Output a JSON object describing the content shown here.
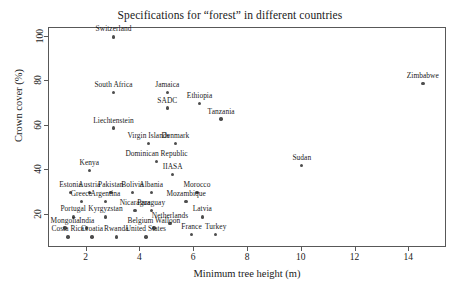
{
  "chart_data": {
    "type": "scatter",
    "title": "Specifications for “forest” in different countries",
    "xlabel": "Minimum tree height (m)",
    "ylabel": "Crown cover (%)",
    "xlim": [
      0.6,
      15.4
    ],
    "ylim": [
      5,
      104
    ],
    "grid": false,
    "legend": null,
    "xticks": [
      2,
      4,
      6,
      8,
      10,
      12,
      14
    ],
    "yticks": [
      20,
      40,
      60,
      80,
      100
    ],
    "point_label_position": "above",
    "marker_color": "#4d4d4d",
    "axis_color": "#585858",
    "points": [
      {
        "label": "Switzerland",
        "x": 3.0,
        "y": 100
      },
      {
        "label": "Zimbabwe",
        "x": 14.5,
        "y": 79
      },
      {
        "label": "South Africa",
        "x": 3.0,
        "y": 75
      },
      {
        "label": "Jamaica",
        "x": 5.0,
        "y": 75
      },
      {
        "label": "SADC",
        "x": 5.0,
        "y": 68
      },
      {
        "label": "Ethiopia",
        "x": 6.2,
        "y": 70
      },
      {
        "label": "Tanzania",
        "x": 7.0,
        "y": 63
      },
      {
        "label": "Liechtenstein",
        "x": 3.0,
        "y": 59
      },
      {
        "label": "Virgin Islands",
        "x": 4.3,
        "y": 52
      },
      {
        "label": "Denmark",
        "x": 5.3,
        "y": 52
      },
      {
        "label": "Dominican Republic",
        "x": 4.6,
        "y": 44
      },
      {
        "label": "Kenya",
        "x": 2.1,
        "y": 40
      },
      {
        "label": "Sudan",
        "x": 10.0,
        "y": 42
      },
      {
        "label": "IIASA",
        "x": 5.2,
        "y": 38
      },
      {
        "label": "Estonia",
        "x": 1.4,
        "y": 30
      },
      {
        "label": "Austria",
        "x": 2.1,
        "y": 30
      },
      {
        "label": "Pakistan",
        "x": 2.9,
        "y": 30
      },
      {
        "label": "Bolivia",
        "x": 3.7,
        "y": 30
      },
      {
        "label": "Albania",
        "x": 4.4,
        "y": 30
      },
      {
        "label": "Morocco",
        "x": 6.1,
        "y": 30
      },
      {
        "label": "Greece",
        "x": 1.8,
        "y": 26
      },
      {
        "label": "Argentina",
        "x": 2.7,
        "y": 26
      },
      {
        "label": "Mozambique",
        "x": 5.7,
        "y": 26
      },
      {
        "label": "Nicaragua",
        "x": 3.8,
        "y": 22
      },
      {
        "label": "Paraguay",
        "x": 4.4,
        "y": 22
      },
      {
        "label": "Portugal",
        "x": 1.5,
        "y": 19
      },
      {
        "label": "Kyrgyzstan",
        "x": 2.7,
        "y": 19
      },
      {
        "label": "Latvia",
        "x": 6.3,
        "y": 19
      },
      {
        "label": "Netherlands",
        "x": 5.1,
        "y": 16
      },
      {
        "label": "Mongolia",
        "x": 1.2,
        "y": 14
      },
      {
        "label": "India",
        "x": 2.0,
        "y": 14
      },
      {
        "label": "Belgium Walloon",
        "x": 4.5,
        "y": 14
      },
      {
        "label": "France",
        "x": 5.9,
        "y": 11
      },
      {
        "label": "Turkey",
        "x": 6.8,
        "y": 11
      },
      {
        "label": "Costa Rica",
        "x": 1.3,
        "y": 10
      },
      {
        "label": "Croatia",
        "x": 2.2,
        "y": 10
      },
      {
        "label": "Rwanda",
        "x": 3.1,
        "y": 10
      },
      {
        "label": "United States",
        "x": 4.2,
        "y": 10
      }
    ]
  }
}
